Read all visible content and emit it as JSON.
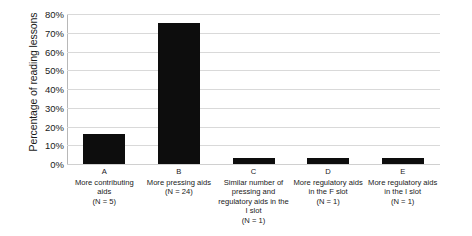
{
  "chart_data": {
    "type": "bar",
    "title": "",
    "xlabel": "",
    "ylabel": "Percentage of reading lessons",
    "ylim": [
      0,
      80
    ],
    "ytick_labels": [
      "80%",
      "70%",
      "60%",
      "50%",
      "40%",
      "30%",
      "20%",
      "10%",
      "0%"
    ],
    "ytick_values": [
      80,
      70,
      60,
      50,
      40,
      30,
      20,
      10,
      0
    ],
    "grid": true,
    "legend": "none",
    "bar_color": "#0d0d0d",
    "gridline_color": "#d9d9d9",
    "categories": [
      "A",
      "B",
      "C",
      "D",
      "E"
    ],
    "category_descriptions": [
      "More contributing aids",
      "More pressing aids",
      "Similar number of pressing and regulatory aids in the I slot",
      "More regulatory aids in the F slot",
      "More regulatory aids in the I slot"
    ],
    "category_counts": [
      "(N = 5)",
      "(N = 24)",
      "(N = 1)",
      "(N = 1)",
      "(N = 1)"
    ],
    "values": [
      16,
      75,
      3,
      3,
      3
    ]
  }
}
